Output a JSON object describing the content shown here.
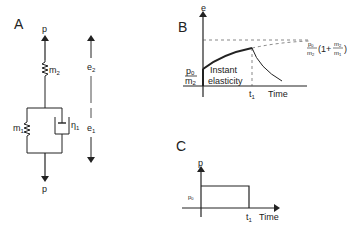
{
  "figure": {
    "panels": {
      "A": {
        "label": "A",
        "load_top": "p",
        "load_bottom": "p",
        "spring_series": "m",
        "spring_series_sub": "2",
        "spring_parallel": "m",
        "spring_parallel_sub": "1",
        "dashpot": "η",
        "dashpot_sub": "1",
        "strain_upper": "e",
        "strain_upper_sub": "2",
        "strain_lower": "e",
        "strain_lower_sub": "1"
      },
      "B": {
        "label": "B",
        "y_axis": "e",
        "x_axis": "Time",
        "t_label": "t",
        "t_sub": "1",
        "initial_num": "p",
        "initial_num_sub": "0",
        "initial_den": "m",
        "initial_den_sub": "2",
        "annotation_line1": "Instant",
        "annotation_line2": "elasticity",
        "asymptote_num": "p",
        "asymptote_num_sub": "0",
        "asymptote_den": "m",
        "asymptote_den_sub": "2",
        "asymptote_factor_open": "(1+",
        "asymptote_factor_num": "m",
        "asymptote_factor_num_sub": "2",
        "asymptote_factor_den": "m",
        "asymptote_factor_den_sub": "1",
        "asymptote_factor_close": ")"
      },
      "C": {
        "label": "C",
        "y_axis": "p",
        "x_axis": "Time",
        "t_label": "t",
        "t_sub": "1",
        "level": "p",
        "level_sub": "0"
      }
    },
    "colors": {
      "ink": "#222222",
      "background": "#ffffff"
    }
  }
}
